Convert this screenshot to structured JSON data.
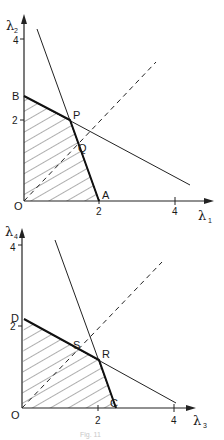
{
  "diagrams": [
    {
      "x_axis": {
        "symbol": "λ",
        "subscript": "1",
        "ticks": [
          "2",
          "4"
        ]
      },
      "y_axis": {
        "symbol": "λ",
        "subscript": "2",
        "ticks": [
          "2",
          "4"
        ]
      },
      "origin_label": "O",
      "points": {
        "A": "A",
        "B": "B",
        "P": "P",
        "Q": "Q"
      }
    },
    {
      "x_axis": {
        "symbol": "λ",
        "subscript": "3",
        "ticks": [
          "2",
          "4"
        ]
      },
      "y_axis": {
        "symbol": "λ",
        "subscript": "4",
        "ticks": [
          "2",
          "4"
        ]
      },
      "origin_label": "O",
      "points": {
        "C": "C",
        "D": "D",
        "R": "R",
        "S": "S"
      }
    }
  ],
  "caption": "Fig. 11"
}
